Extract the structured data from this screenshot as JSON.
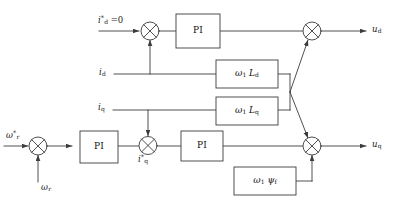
{
  "diagram": {
    "canvas": {
      "width": 397,
      "height": 210
    },
    "colors": {
      "line": "#3c3c3c",
      "block_border": "#3c3c3c",
      "background": "#ffffff",
      "text": "#1a1a1a"
    },
    "signals": {
      "id_ref": "i*d = 0",
      "id_feedback": "id",
      "iq_feedback": "iq",
      "iq_ref": "i*q",
      "speed_ref": "ω*r",
      "speed_feedback": "ωr",
      "ud_output": "ud",
      "uq_output": "uq"
    },
    "blocks": [
      {
        "id": "pi-d-current",
        "label": "PI",
        "x": 176,
        "y": 14,
        "w": 44,
        "h": 28
      },
      {
        "id": "gain-omega-ld",
        "label": "ω1 Ld",
        "x": 216,
        "y": 60,
        "w": 62,
        "h": 26
      },
      {
        "id": "gain-omega-lq",
        "label": "ω1 Lq",
        "x": 216,
        "y": 97,
        "w": 62,
        "h": 26
      },
      {
        "id": "pi-speed",
        "label": "PI",
        "x": 80,
        "y": 131,
        "w": 38,
        "h": 30
      },
      {
        "id": "pi-q-current",
        "label": "PI",
        "x": 181,
        "y": 131,
        "w": 42,
        "h": 28
      },
      {
        "id": "gain-omega-psif",
        "label": "ω1 ψf",
        "x": 234,
        "y": 167,
        "w": 62,
        "h": 28
      }
    ],
    "summing_junctions": [
      {
        "id": "sum-d-current",
        "cx": 150,
        "cy": 31,
        "r": 9
      },
      {
        "id": "sum-ud",
        "cx": 312,
        "cy": 31,
        "r": 9
      },
      {
        "id": "sum-speed",
        "cx": 38,
        "cy": 146,
        "r": 9
      },
      {
        "id": "sum-q-current",
        "cx": 148,
        "cy": 145,
        "r": 9
      },
      {
        "id": "sum-uq",
        "cx": 312,
        "cy": 146,
        "r": 9
      }
    ],
    "labels": {
      "pi": "PI",
      "omega1_ld": "ω₁ L_d",
      "omega1_lq": "ω₁ L_q",
      "omega1_psif": "ω₁ ψ_f"
    }
  }
}
